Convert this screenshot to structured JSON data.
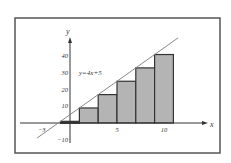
{
  "chart_data": {
    "type": "bar",
    "title": "",
    "xlabel": "x",
    "ylabel": "y",
    "annotation": "y=4x+5",
    "line": {
      "slope": 4,
      "intercept": 5,
      "x_range": [
        -3.5,
        11.5
      ]
    },
    "bars": [
      {
        "x0": -1,
        "x1": 1,
        "height": 1
      },
      {
        "x0": 1,
        "x1": 3,
        "height": 9
      },
      {
        "x0": 3,
        "x1": 5,
        "height": 17
      },
      {
        "x0": 5,
        "x1": 7,
        "height": 25
      },
      {
        "x0": 7,
        "x1": 9,
        "height": 33
      },
      {
        "x0": 9,
        "x1": 11,
        "height": 41
      }
    ],
    "x_ticks": [
      {
        "value": -3,
        "label": "−3"
      },
      {
        "value": 5,
        "label": "5"
      },
      {
        "value": 10,
        "label": "10"
      }
    ],
    "y_ticks": [
      {
        "value": -10,
        "label": "−10"
      },
      {
        "value": 10,
        "label": "10"
      },
      {
        "value": 20,
        "label": "20"
      },
      {
        "value": 30,
        "label": "30"
      },
      {
        "value": 40,
        "label": "40"
      }
    ],
    "xlim": [
      -3,
      12
    ],
    "ylim": [
      -10,
      50
    ],
    "grid": false,
    "legend": null,
    "colors": {
      "bar_fill": "#b4b4b4",
      "bar_edge": "#333333",
      "line": "#888888",
      "frame": "#555555"
    }
  }
}
